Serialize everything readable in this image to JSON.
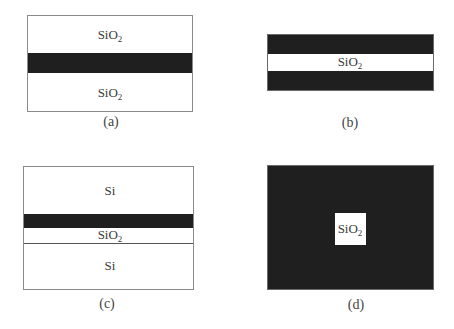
{
  "panels": {
    "a": {
      "caption": "(a)",
      "layers": [
        {
          "material": "SiO",
          "subscript": "2",
          "fill": "#ffffff"
        },
        {
          "material": "dark-layer",
          "fill": "#1f1f1f"
        },
        {
          "material": "SiO",
          "subscript": "2",
          "fill": "#ffffff"
        }
      ],
      "top_label": {
        "main": "SiO",
        "sub": "2"
      },
      "bottom_label": {
        "main": "SiO",
        "sub": "2"
      }
    },
    "b": {
      "caption": "(b)",
      "layers": [
        {
          "material": "dark-layer",
          "fill": "#1f1f1f"
        },
        {
          "material": "SiO",
          "subscript": "2",
          "fill": "#ffffff"
        },
        {
          "material": "dark-layer",
          "fill": "#1f1f1f"
        }
      ],
      "middle_label": {
        "main": "SiO",
        "sub": "2"
      }
    },
    "c": {
      "caption": "(c)",
      "layers": [
        {
          "material": "Si",
          "fill": "#ffffff"
        },
        {
          "material": "dark-layer",
          "fill": "#1f1f1f"
        },
        {
          "material": "SiO",
          "subscript": "2",
          "fill": "#ffffff"
        },
        {
          "material": "Si",
          "fill": "#ffffff"
        }
      ],
      "top_label": {
        "main": "Si"
      },
      "middle_label": {
        "main": "SiO",
        "sub": "2"
      },
      "bottom_label": {
        "main": "Si"
      }
    },
    "d": {
      "caption": "(d)",
      "background_fill": "#1f1f1f",
      "center_label": {
        "main": "SiO",
        "sub": "2"
      }
    }
  },
  "colors": {
    "dark": "#1f1f1f",
    "light": "#ffffff",
    "outline": "#8a8a8a",
    "text": "#3a3a3a"
  }
}
